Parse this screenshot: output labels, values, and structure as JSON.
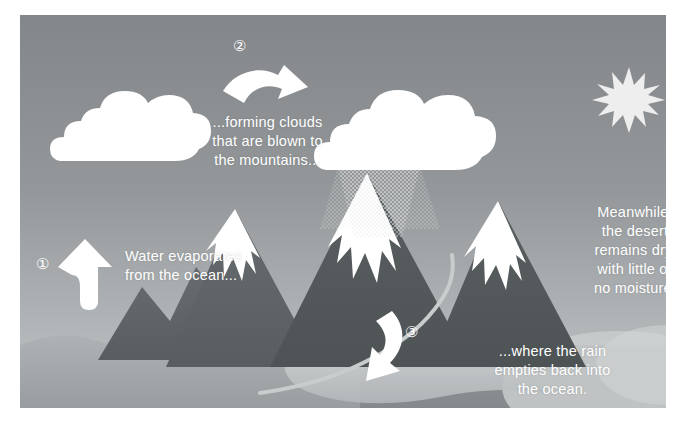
{
  "diagram": {
    "background_color": "#8e9193",
    "frame_color": "#ffffff",
    "text_color": "#ffffff"
  },
  "steps": [
    {
      "number": "1",
      "marker": "①",
      "caption": "Water evaporates\nfrom the ocean...",
      "arrow": "up-arrow",
      "arrow_direction": "up"
    },
    {
      "number": "2",
      "marker": "②",
      "caption": "...forming clouds\nthat are blown to\nthe mountains...",
      "arrow": "curved-right-arrow",
      "arrow_direction": "right"
    },
    {
      "number": "3",
      "marker": "③",
      "caption": "...where the rain\nempties back into\nthe ocean.",
      "arrow": "curved-down-left-arrow",
      "arrow_direction": "down-left"
    }
  ],
  "side_note": {
    "caption": "Meanwhile,\nthe desert\nremains dry,\nwith little or\nno moisture."
  },
  "scene": {
    "sun": "sun-starburst",
    "cloud_left": "cloud-shape",
    "cloud_rain": "rain-cloud-shape",
    "rain": "rain-halftone",
    "mountains": "three-peaks-with-snow",
    "ocean": "wavy-ocean",
    "river": "river-line",
    "desert_dune": "dune-ellipse"
  },
  "colors": {
    "sky_top": "#87898b",
    "sky_bottom": "#b9bcbd",
    "mountain_dark": "#5c6063",
    "mountain_mid": "#6e7376",
    "snow": "#ffffff",
    "ocean": "#a3a7a9",
    "shore": "#c7cacb",
    "desert": "#9a9d9f",
    "cloud": "#ffffff",
    "sun": "#efefef"
  }
}
